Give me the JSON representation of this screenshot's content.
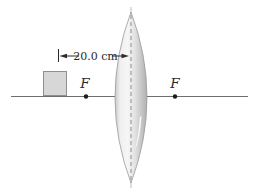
{
  "diagram": {
    "dimension": {
      "label": "20.0 cm"
    },
    "focal_points": {
      "left_label": "F",
      "right_label": "F"
    },
    "colors": {
      "background": "#ffffff",
      "axis_line": "#6e6e6e",
      "object_fill": "#d7d7d7",
      "object_border": "#8f8f8f",
      "lens_outline": "#9b9b9b",
      "lens_light": "#f6f6f6",
      "lens_dark": "#b0b0b0",
      "lens_left_rim": "#c9c9c9",
      "dashed_center_line": "#8c8c8c",
      "annotation_ink": "#2b2b2b"
    }
  }
}
